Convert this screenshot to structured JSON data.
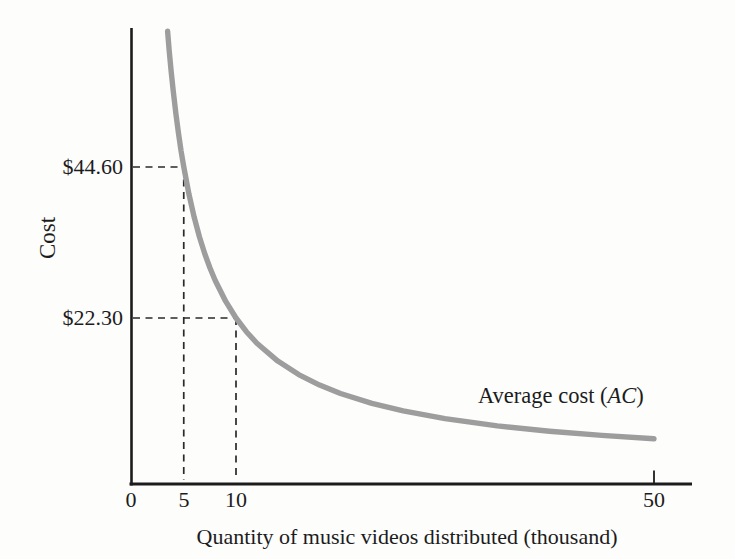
{
  "chart_data": {
    "type": "line",
    "title": "",
    "xlabel": "Quantity of music videos distributed (thousand)",
    "ylabel": "Cost",
    "x_range": [
      0,
      53
    ],
    "grid": false,
    "legend_position": "inline-annotation",
    "axis_color": "#1c1c1c",
    "guide_color": "#2a2a2a",
    "x_ticks": [
      {
        "value": 0,
        "label": "0",
        "tick_mark": false
      },
      {
        "value": 5,
        "label": "5",
        "tick_mark": false
      },
      {
        "value": 10,
        "label": "10",
        "tick_mark": false
      },
      {
        "value": 50,
        "label": "50",
        "tick_mark": true
      }
    ],
    "series": [
      {
        "name": "Average cost (AC)",
        "label_plain": "Average cost (",
        "label_italic": "AC",
        "label_close": ")",
        "color": "#9d9d9d",
        "points": [
          [
            3.45,
            64.64
          ],
          [
            3.6,
            61.94
          ],
          [
            3.8,
            58.68
          ],
          [
            4,
            55.75
          ],
          [
            4.25,
            52.47
          ],
          [
            4.5,
            49.56
          ],
          [
            4.75,
            46.95
          ],
          [
            5,
            44.6
          ],
          [
            5.5,
            40.55
          ],
          [
            6,
            37.17
          ],
          [
            6.5,
            34.31
          ],
          [
            7,
            31.86
          ],
          [
            7.5,
            29.73
          ],
          [
            8,
            27.88
          ],
          [
            9,
            24.78
          ],
          [
            10,
            22.3
          ],
          [
            11,
            20.27
          ],
          [
            12,
            18.58
          ],
          [
            14,
            15.93
          ],
          [
            16,
            13.94
          ],
          [
            18,
            12.39
          ],
          [
            20,
            11.15
          ],
          [
            23,
            9.7
          ],
          [
            26,
            8.58
          ],
          [
            30,
            7.43
          ],
          [
            35,
            6.37
          ],
          [
            40,
            5.58
          ],
          [
            45,
            4.96
          ],
          [
            50,
            4.46
          ]
        ]
      }
    ],
    "guides": [
      {
        "x": 5,
        "y": 44.6,
        "label": "$44.60"
      },
      {
        "x": 10,
        "y": 22.3,
        "label": "$22.30"
      }
    ]
  }
}
